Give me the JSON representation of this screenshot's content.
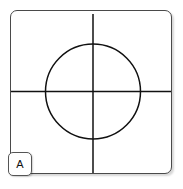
{
  "figure": {
    "panel_label": "A",
    "alt_description": "Square panel containing a circle with a crosshair of one vertical and one horizontal line crossing at the circle center",
    "colors": {
      "background": "#ffffff",
      "panel_fill": "#ffffff",
      "panel_border": "#4a4a4a",
      "stroke": "#111111",
      "label_border": "#555555",
      "label_text": "#111111"
    },
    "canvas": {
      "width": 183,
      "height": 189
    },
    "panel": {
      "x": 10,
      "y": 10,
      "width": 162,
      "height": 164,
      "corner_radius": 7,
      "border_width": 1
    },
    "shapes": {
      "circle": {
        "name": "circle-outline",
        "center_x": 83,
        "center_y": 81.5,
        "radius": 47.5,
        "stroke_width": 1.5,
        "fill": "none"
      },
      "vertical_line": {
        "name": "crosshair-vertical-line",
        "x": 83,
        "y1": 4,
        "y2": 163,
        "stroke_width": 1.5
      },
      "horizontal_line": {
        "name": "crosshair-horizontal-line",
        "y": 81.5,
        "x1": 1,
        "x2": 161,
        "stroke_width": 1.5
      }
    },
    "label_badge": {
      "x": 8,
      "y": 152,
      "size": 24,
      "corner_radius": 5
    }
  }
}
